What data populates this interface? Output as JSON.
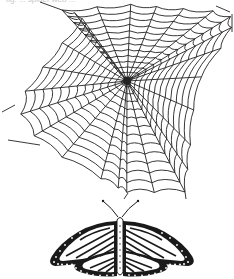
{
  "caption": "fig. ... spider web ...",
  "illustrations": {
    "web": {
      "label": "spider-web",
      "center": [
        127,
        81
      ],
      "anchor_points": [
        [
          62,
          10
        ],
        [
          127,
          4
        ],
        [
          175,
          8
        ],
        [
          230,
          12
        ],
        [
          232,
          32
        ],
        [
          196,
          85
        ],
        [
          190,
          150
        ],
        [
          185,
          192
        ],
        [
          128,
          193
        ],
        [
          112,
          185
        ],
        [
          40,
          145
        ],
        [
          15,
          105
        ],
        [
          48,
          60
        ],
        [
          85,
          15
        ]
      ],
      "spoke_count": 26,
      "ring_count": 13,
      "stroke": "#222222"
    },
    "butterfly": {
      "label": "monarch-butterfly",
      "body_x": 120,
      "top_y": 203,
      "bottom_y": 278,
      "left_x": 48,
      "right_x": 195,
      "fill": "#1a1a1a"
    }
  }
}
